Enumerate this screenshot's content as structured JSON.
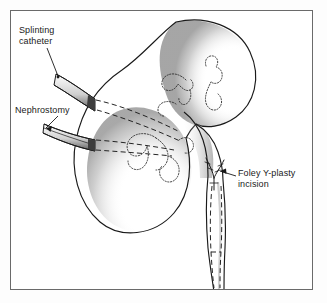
{
  "figure": {
    "style": "line-drawing-with-stipple-shading",
    "frame_color": "#6a6a6a",
    "background_color": "#ffffff",
    "ink_color": "#1a1a1a"
  },
  "labels": {
    "splinting_catheter": "Splinting\ncatheter",
    "nephrostomy": "Nephrostomy",
    "foley_y_plasty": "Foley Y-plasty\nincision"
  },
  "anatomy": {
    "upper_pole": "upper renal pole",
    "lower_pole": "lower renal pole",
    "calyces": "minor and major calyces",
    "renal_pelvis": "renal pelvis",
    "ureter": "ureter"
  },
  "instruments": {
    "splinting_catheter_tube": "splinting catheter tube",
    "nephrostomy_tube": "nephrostomy tube",
    "catheter_dashed_path": "catheter path shown dashed"
  }
}
